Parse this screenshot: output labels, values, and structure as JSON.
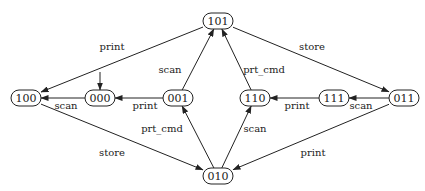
{
  "diagram": {
    "type": "state-machine",
    "nodes": [
      {
        "id": "100",
        "label": "100",
        "x": 26,
        "y": 98
      },
      {
        "id": "000",
        "label": "000",
        "x": 100,
        "y": 98
      },
      {
        "id": "001",
        "label": "001",
        "x": 178,
        "y": 98
      },
      {
        "id": "101",
        "label": "101",
        "x": 218,
        "y": 21
      },
      {
        "id": "110",
        "label": "110",
        "x": 255,
        "y": 98
      },
      {
        "id": "111",
        "label": "111",
        "x": 334,
        "y": 98
      },
      {
        "id": "011",
        "label": "011",
        "x": 404,
        "y": 98
      },
      {
        "id": "010",
        "label": "010",
        "x": 218,
        "y": 176
      }
    ],
    "initial_state": "000",
    "edges": [
      {
        "from": "101",
        "to": "100",
        "label": "print",
        "lx": 112,
        "ly": 46
      },
      {
        "from": "001",
        "to": "000",
        "label": "print",
        "lx": 145,
        "ly": 105
      },
      {
        "from": "000",
        "to": "100",
        "label": "scan",
        "lx": 66,
        "ly": 105
      },
      {
        "from": "001",
        "to": "101",
        "label": "scan",
        "lx": 170,
        "ly": 69
      },
      {
        "from": "010",
        "to": "001",
        "label": "prt_cmd",
        "lx": 162,
        "ly": 128
      },
      {
        "from": "100",
        "to": "010",
        "label": "store",
        "lx": 112,
        "ly": 152
      },
      {
        "from": "110",
        "to": "101",
        "label": "prt_cmd",
        "lx": 264,
        "ly": 69
      },
      {
        "from": "101",
        "to": "011",
        "label": "store",
        "lx": 312,
        "ly": 46
      },
      {
        "from": "111",
        "to": "110",
        "label": "print",
        "lx": 297,
        "ly": 105
      },
      {
        "from": "011",
        "to": "111",
        "label": "scan",
        "lx": 361,
        "ly": 105
      },
      {
        "from": "010",
        "to": "110",
        "label": "scan",
        "lx": 255,
        "ly": 128
      },
      {
        "from": "011",
        "to": "010",
        "label": "print",
        "lx": 313,
        "ly": 152
      }
    ]
  }
}
